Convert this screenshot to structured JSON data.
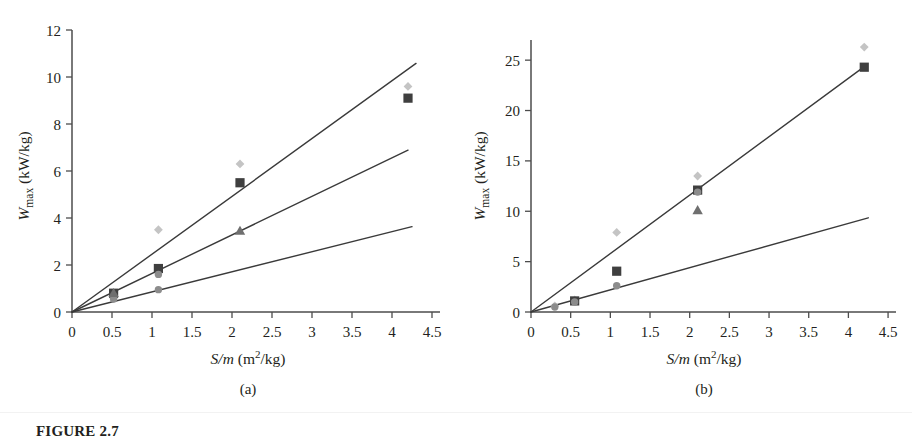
{
  "figure": {
    "caption_label": "FIGURE 2.7",
    "panels": [
      {
        "id": "a",
        "sub_caption": "(a)",
        "xlabel_main": "S/m",
        "xlabel_units": " (m",
        "xlabel_exp": "2",
        "xlabel_tail": "/kg)",
        "ylabel_main": "W",
        "ylabel_sub": "max",
        "ylabel_units": " (kW/kg)",
        "xticks": [
          "0",
          "0.5",
          "1",
          "1.5",
          "2",
          "2.5",
          "3",
          "3.5",
          "4",
          "4.5"
        ],
        "yticks": [
          "0",
          "2",
          "4",
          "6",
          "8",
          "10",
          "12"
        ]
      },
      {
        "id": "b",
        "sub_caption": "(b)",
        "xlabel_main": "S/m",
        "xlabel_units": " (m",
        "xlabel_exp": "2",
        "xlabel_tail": "/kg)",
        "ylabel_main": "W",
        "ylabel_sub": "max",
        "ylabel_units": " (kW/kg)",
        "xticks": [
          "0",
          "0.5",
          "1",
          "1.5",
          "2",
          "2.5",
          "3",
          "3.5",
          "4",
          "4.5"
        ],
        "yticks": [
          "0",
          "5",
          "10",
          "15",
          "20",
          "25"
        ]
      }
    ]
  },
  "colors": {
    "axis": "#4c4c4c",
    "fit_line": "#3a3a3a",
    "marker_dark_square": "#3f3f3f",
    "marker_mid_gray": "#8c8c8c",
    "marker_light_diamond": "#c4c4c4",
    "marker_triangle": "#6f6f6f",
    "text": "#231f20"
  },
  "chart_data": [
    {
      "type": "scatter",
      "panel": "a",
      "title": "",
      "xlabel": "S/m (m2/kg)",
      "ylabel": "Wmax (kW/kg)",
      "xlim": [
        0,
        4.6
      ],
      "ylim": [
        0,
        12
      ],
      "xticks": [
        0,
        0.5,
        1,
        1.5,
        2,
        2.5,
        3,
        3.5,
        4,
        4.5
      ],
      "yticks": [
        0,
        2,
        4,
        6,
        8,
        10,
        12
      ],
      "grid": false,
      "legend": "none",
      "series": [
        {
          "name": "light-gray-diamond",
          "marker": "diamond",
          "color": "#c4c4c4",
          "points": [
            [
              0.52,
              0.6
            ],
            [
              1.08,
              3.5
            ],
            [
              2.1,
              6.3
            ],
            [
              4.2,
              9.6
            ]
          ]
        },
        {
          "name": "dark-square",
          "marker": "square",
          "color": "#3f3f3f",
          "points": [
            [
              0.52,
              0.8
            ],
            [
              1.08,
              1.85
            ],
            [
              2.1,
              5.5
            ],
            [
              4.2,
              9.1
            ]
          ]
        },
        {
          "name": "mid-gray-circle",
          "marker": "circle",
          "color": "#8c8c8c",
          "points": [
            [
              0.52,
              0.55
            ],
            [
              1.08,
              1.6
            ],
            [
              1.08,
              0.95
            ]
          ]
        },
        {
          "name": "gray-triangle",
          "marker": "triangle",
          "color": "#6f6f6f",
          "points": [
            [
              0.52,
              0.8
            ],
            [
              2.1,
              3.45
            ]
          ]
        }
      ],
      "fit_lines": [
        {
          "name": "upper-fit",
          "slope": 2.46,
          "intercept": 0.0,
          "x_range": [
            0,
            4.3
          ]
        },
        {
          "name": "middle-fit",
          "slope": 1.64,
          "intercept": 0.0,
          "x_range": [
            0,
            4.2
          ]
        },
        {
          "name": "lower-fit",
          "slope": 0.855,
          "intercept": 0.0,
          "x_range": [
            0,
            4.25
          ]
        }
      ]
    },
    {
      "type": "scatter",
      "panel": "b",
      "title": "",
      "xlabel": "S/m (m2/kg)",
      "ylabel": "Wmax (kW/kg)",
      "xlim": [
        0,
        4.6
      ],
      "ylim": [
        0,
        27
      ],
      "xticks": [
        0,
        0.5,
        1,
        1.5,
        2,
        2.5,
        3,
        3.5,
        4,
        4.5
      ],
      "yticks": [
        0,
        5,
        10,
        15,
        20,
        25
      ],
      "grid": false,
      "legend": "none",
      "series": [
        {
          "name": "light-gray-diamond",
          "marker": "diamond",
          "color": "#c4c4c4",
          "points": [
            [
              0.3,
              0.6
            ],
            [
              0.55,
              1.2
            ],
            [
              1.08,
              7.9
            ],
            [
              2.1,
              13.5
            ],
            [
              4.2,
              26.3
            ]
          ]
        },
        {
          "name": "dark-square",
          "marker": "square",
          "color": "#3f3f3f",
          "points": [
            [
              0.55,
              1.1
            ],
            [
              1.08,
              4.05
            ],
            [
              2.1,
              12.1
            ],
            [
              4.2,
              24.3
            ]
          ]
        },
        {
          "name": "mid-gray-circle",
          "marker": "circle",
          "color": "#8c8c8c",
          "points": [
            [
              0.3,
              0.5
            ],
            [
              0.55,
              1.0
            ],
            [
              1.08,
              2.6
            ],
            [
              2.1,
              11.9
            ]
          ]
        },
        {
          "name": "gray-triangle",
          "marker": "triangle",
          "color": "#6f6f6f",
          "points": [
            [
              2.1,
              10.1
            ]
          ]
        }
      ],
      "fit_lines": [
        {
          "name": "upper-fit",
          "slope": 5.8,
          "intercept": 0.0,
          "x_range": [
            0,
            4.2
          ]
        },
        {
          "name": "lower-fit",
          "slope": 2.2,
          "intercept": 0.0,
          "x_range": [
            0,
            4.25
          ]
        }
      ]
    }
  ]
}
